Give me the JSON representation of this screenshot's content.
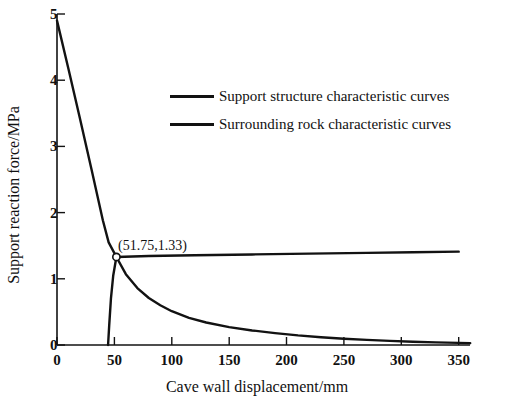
{
  "chart_data": {
    "type": "line",
    "title": "",
    "xlabel": "Cave wall displacement/mm",
    "ylabel": "Support reaction force/MPa",
    "xlim": [
      0,
      360
    ],
    "ylim": [
      0,
      5
    ],
    "xticks": [
      0,
      50,
      100,
      150,
      200,
      250,
      300,
      350
    ],
    "xtick_labels": [
      "0",
      "50",
      "100",
      "150",
      "200",
      "250",
      "300",
      "350"
    ],
    "yticks": [
      0,
      1,
      2,
      3,
      4,
      5
    ],
    "ytick_labels": [
      "0",
      "1",
      "2",
      "3",
      "4",
      "5"
    ],
    "grid": false,
    "legend_position": "upper center",
    "series": [
      {
        "name": "Support structure characteristic curves",
        "color": "#121212",
        "points": [
          [
            44.5,
            0.0
          ],
          [
            45.5,
            0.3
          ],
          [
            47.0,
            0.7
          ],
          [
            49.0,
            1.05
          ],
          [
            51.75,
            1.33
          ],
          [
            80.0,
            1.345
          ],
          [
            120.0,
            1.355
          ],
          [
            170.0,
            1.368
          ],
          [
            220.0,
            1.38
          ],
          [
            270.0,
            1.392
          ],
          [
            310.0,
            1.4
          ],
          [
            350.0,
            1.41
          ]
        ]
      },
      {
        "name": "Surrounding rock characteristic curves",
        "color": "#121212",
        "points": [
          [
            0.0,
            4.9
          ],
          [
            10.0,
            4.17
          ],
          [
            20.0,
            3.42
          ],
          [
            30.0,
            2.66
          ],
          [
            40.0,
            1.88
          ],
          [
            45.0,
            1.55
          ],
          [
            51.75,
            1.33
          ],
          [
            60.0,
            1.07
          ],
          [
            70.0,
            0.86
          ],
          [
            80.0,
            0.71
          ],
          [
            90.0,
            0.6
          ],
          [
            100.0,
            0.51
          ],
          [
            115.0,
            0.41
          ],
          [
            130.0,
            0.34
          ],
          [
            150.0,
            0.27
          ],
          [
            170.0,
            0.22
          ],
          [
            190.0,
            0.18
          ],
          [
            210.0,
            0.145
          ],
          [
            230.0,
            0.118
          ],
          [
            250.0,
            0.095
          ],
          [
            270.0,
            0.077
          ],
          [
            290.0,
            0.062
          ],
          [
            310.0,
            0.05
          ],
          [
            330.0,
            0.04
          ],
          [
            350.0,
            0.032
          ],
          [
            360.0,
            0.028
          ]
        ]
      }
    ],
    "annotations": [
      {
        "label": "(51.75,1.33)",
        "x": 51.75,
        "y": 1.33,
        "marker": "open-circle"
      }
    ]
  },
  "axes": {
    "x_title": "Cave wall displacement/mm",
    "y_title": "Support reaction force/MPa",
    "x_tick_labels": [
      "0",
      "50",
      "100",
      "150",
      "200",
      "250",
      "300",
      "350"
    ],
    "y_tick_labels": [
      "0",
      "1",
      "2",
      "3",
      "4",
      "5"
    ]
  },
  "legend": {
    "items": [
      {
        "label": "Support structure characteristic curves"
      },
      {
        "label": "Surrounding rock characteristic curves"
      }
    ]
  },
  "annotation": {
    "intersection_label": "(51.75,1.33)"
  }
}
